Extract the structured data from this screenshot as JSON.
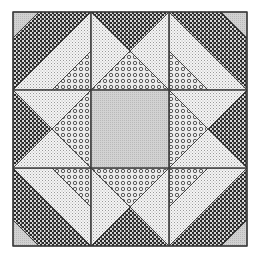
{
  "figure": {
    "title": "Quilt block with patterned fabrics",
    "origin": [
      13,
      12
    ],
    "size": 234,
    "grid": 3
  },
  "fabrics": {
    "dark-checker": {
      "fg": "#2a2a2a",
      "bg": "#d8d8d8"
    },
    "light-dotted": {
      "fg": "#9a9a9a",
      "bg": "#f4f4f4"
    },
    "circle-print": {
      "fg": "#4a4a4a",
      "bg": "#ececec"
    },
    "gray-solid": {
      "fg": "#a8a8a8",
      "bg": "#d2d2d2"
    }
  },
  "border": {
    "color": "#3a3a3a",
    "width": 1.4
  },
  "regions": [
    {
      "name": "corner-tl-gray",
      "fabric": "gray-solid",
      "points": [
        [
          0,
          0
        ],
        [
          0.333,
          0
        ],
        [
          0,
          0.333
        ]
      ],
      "cell": [
        0,
        0
      ]
    },
    {
      "name": "corner-tl-checker",
      "fabric": "dark-checker",
      "points": [
        [
          0.333,
          0
        ],
        [
          1,
          0
        ],
        [
          0,
          1
        ],
        [
          0,
          0.333
        ]
      ],
      "cell": [
        0,
        0
      ]
    },
    {
      "name": "corner-tl-dotted",
      "fabric": "light-dotted",
      "points": [
        [
          1,
          0
        ],
        [
          1,
          0.5
        ],
        [
          0.5,
          1
        ],
        [
          0,
          1
        ]
      ],
      "cell": [
        0,
        0
      ]
    },
    {
      "name": "corner-tl-circle",
      "fabric": "circle-print",
      "points": [
        [
          1,
          0.5
        ],
        [
          1,
          1
        ],
        [
          0.5,
          1
        ]
      ],
      "cell": [
        0,
        0
      ]
    },
    {
      "name": "corner-tr-gray",
      "fabric": "gray-solid",
      "points": [
        [
          1,
          0
        ],
        [
          1,
          0.333
        ],
        [
          0.667,
          0
        ]
      ],
      "cell": [
        2,
        0
      ]
    },
    {
      "name": "corner-tr-checker",
      "fabric": "dark-checker",
      "points": [
        [
          0.667,
          0
        ],
        [
          0,
          0
        ],
        [
          1,
          1
        ],
        [
          1,
          0.333
        ]
      ],
      "cell": [
        2,
        0
      ]
    },
    {
      "name": "corner-tr-dotted",
      "fabric": "light-dotted",
      "points": [
        [
          0,
          0
        ],
        [
          0,
          0.5
        ],
        [
          0.5,
          1
        ],
        [
          1,
          1
        ]
      ],
      "cell": [
        2,
        0
      ]
    },
    {
      "name": "corner-tr-circle",
      "fabric": "circle-print",
      "points": [
        [
          0,
          0.5
        ],
        [
          0,
          1
        ],
        [
          0.5,
          1
        ]
      ],
      "cell": [
        2,
        0
      ]
    },
    {
      "name": "corner-bl-gray",
      "fabric": "gray-solid",
      "points": [
        [
          0,
          1
        ],
        [
          0,
          0.667
        ],
        [
          0.333,
          1
        ]
      ],
      "cell": [
        0,
        2
      ]
    },
    {
      "name": "corner-bl-checker",
      "fabric": "dark-checker",
      "points": [
        [
          0.333,
          1
        ],
        [
          1,
          1
        ],
        [
          0,
          0
        ],
        [
          0,
          0.667
        ]
      ],
      "cell": [
        0,
        2
      ]
    },
    {
      "name": "corner-bl-dotted",
      "fabric": "light-dotted",
      "points": [
        [
          1,
          1
        ],
        [
          1,
          0.5
        ],
        [
          0.5,
          0
        ],
        [
          0,
          0
        ]
      ],
      "cell": [
        0,
        2
      ]
    },
    {
      "name": "corner-bl-circle",
      "fabric": "circle-print",
      "points": [
        [
          1,
          0.5
        ],
        [
          1,
          0
        ],
        [
          0.5,
          0
        ]
      ],
      "cell": [
        0,
        2
      ]
    },
    {
      "name": "corner-br-gray",
      "fabric": "gray-solid",
      "points": [
        [
          1,
          1
        ],
        [
          0.667,
          1
        ],
        [
          1,
          0.667
        ]
      ],
      "cell": [
        2,
        2
      ]
    },
    {
      "name": "corner-br-checker",
      "fabric": "dark-checker",
      "points": [
        [
          0.667,
          1
        ],
        [
          0,
          1
        ],
        [
          1,
          0
        ],
        [
          1,
          0.667
        ]
      ],
      "cell": [
        2,
        2
      ]
    },
    {
      "name": "corner-br-dotted",
      "fabric": "light-dotted",
      "points": [
        [
          0,
          1
        ],
        [
          0,
          0.5
        ],
        [
          0.5,
          0
        ],
        [
          1,
          0
        ]
      ],
      "cell": [
        2,
        2
      ]
    },
    {
      "name": "corner-br-circle",
      "fabric": "circle-print",
      "points": [
        [
          0,
          0.5
        ],
        [
          0,
          0
        ],
        [
          0.5,
          0
        ]
      ],
      "cell": [
        2,
        2
      ]
    },
    {
      "name": "top-mid-checker",
      "fabric": "dark-checker",
      "points": [
        [
          0,
          0
        ],
        [
          1,
          0
        ],
        [
          0.5,
          0.5
        ]
      ],
      "cell": [
        1,
        0
      ]
    },
    {
      "name": "top-mid-left-dotted",
      "fabric": "light-dotted",
      "points": [
        [
          0,
          0
        ],
        [
          0.5,
          0.5
        ],
        [
          0,
          1
        ]
      ],
      "cell": [
        1,
        0
      ]
    },
    {
      "name": "top-mid-right-dotted",
      "fabric": "light-dotted",
      "points": [
        [
          1,
          0
        ],
        [
          1,
          1
        ],
        [
          0.5,
          0.5
        ]
      ],
      "cell": [
        1,
        0
      ]
    },
    {
      "name": "top-mid-circle",
      "fabric": "circle-print",
      "points": [
        [
          0,
          1
        ],
        [
          0.5,
          0.5
        ],
        [
          1,
          1
        ]
      ],
      "cell": [
        1,
        0
      ]
    },
    {
      "name": "bottom-mid-checker",
      "fabric": "dark-checker",
      "points": [
        [
          0,
          1
        ],
        [
          1,
          1
        ],
        [
          0.5,
          0.5
        ]
      ],
      "cell": [
        1,
        2
      ]
    },
    {
      "name": "bottom-mid-left-dotted",
      "fabric": "light-dotted",
      "points": [
        [
          0,
          1
        ],
        [
          0.5,
          0.5
        ],
        [
          0,
          0
        ]
      ],
      "cell": [
        1,
        2
      ]
    },
    {
      "name": "bottom-mid-right-dotted",
      "fabric": "light-dotted",
      "points": [
        [
          1,
          1
        ],
        [
          1,
          0
        ],
        [
          0.5,
          0.5
        ]
      ],
      "cell": [
        1,
        2
      ]
    },
    {
      "name": "bottom-mid-circle",
      "fabric": "circle-print",
      "points": [
        [
          0,
          0
        ],
        [
          0.5,
          0.5
        ],
        [
          1,
          0
        ]
      ],
      "cell": [
        1,
        2
      ]
    },
    {
      "name": "left-mid-checker",
      "fabric": "dark-checker",
      "points": [
        [
          0,
          0
        ],
        [
          0,
          1
        ],
        [
          0.5,
          0.5
        ]
      ],
      "cell": [
        0,
        1
      ]
    },
    {
      "name": "left-mid-top-dotted",
      "fabric": "light-dotted",
      "points": [
        [
          0,
          0
        ],
        [
          1,
          0
        ],
        [
          0.5,
          0.5
        ]
      ],
      "cell": [
        0,
        1
      ]
    },
    {
      "name": "left-mid-bottom-dotted",
      "fabric": "light-dotted",
      "points": [
        [
          0,
          1
        ],
        [
          0.5,
          0.5
        ],
        [
          1,
          1
        ]
      ],
      "cell": [
        0,
        1
      ]
    },
    {
      "name": "left-mid-circle",
      "fabric": "circle-print",
      "points": [
        [
          1,
          0
        ],
        [
          1,
          1
        ],
        [
          0.5,
          0.5
        ]
      ],
      "cell": [
        0,
        1
      ]
    },
    {
      "name": "right-mid-checker",
      "fabric": "dark-checker",
      "points": [
        [
          1,
          0
        ],
        [
          1,
          1
        ],
        [
          0.5,
          0.5
        ]
      ],
      "cell": [
        2,
        1
      ]
    },
    {
      "name": "right-mid-top-dotted",
      "fabric": "light-dotted",
      "points": [
        [
          1,
          0
        ],
        [
          0,
          0
        ],
        [
          0.5,
          0.5
        ]
      ],
      "cell": [
        2,
        1
      ]
    },
    {
      "name": "right-mid-bottom-dotted",
      "fabric": "light-dotted",
      "points": [
        [
          1,
          1
        ],
        [
          0.5,
          0.5
        ],
        [
          0,
          1
        ]
      ],
      "cell": [
        2,
        1
      ]
    },
    {
      "name": "right-mid-circle",
      "fabric": "circle-print",
      "points": [
        [
          0,
          0
        ],
        [
          0,
          1
        ],
        [
          0.5,
          0.5
        ]
      ],
      "cell": [
        2,
        1
      ]
    },
    {
      "name": "center-square",
      "fabric": "gray-solid",
      "points": [
        [
          0,
          0
        ],
        [
          1,
          0
        ],
        [
          1,
          1
        ],
        [
          0,
          1
        ]
      ],
      "cell": [
        1,
        1
      ]
    }
  ]
}
